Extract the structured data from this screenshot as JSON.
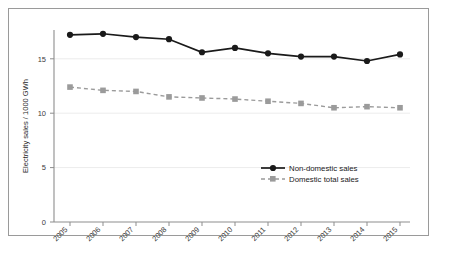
{
  "chart_data": {
    "type": "line",
    "title": "",
    "xlabel": "",
    "ylabel": "Electricity sales / 1000 GWh",
    "categories": [
      "2005",
      "2006",
      "2007",
      "2008",
      "2009",
      "2010",
      "2011",
      "2012",
      "2013",
      "2014",
      "2015"
    ],
    "x": [
      2005,
      2006,
      2007,
      2008,
      2009,
      2010,
      2011,
      2012,
      2013,
      2014,
      2015
    ],
    "ylim": [
      0,
      18.2
    ],
    "yticks": [
      0,
      5,
      10,
      15
    ],
    "ytick_labels": [
      "0",
      "5",
      "10",
      "15"
    ],
    "grid": "horizontal-faint",
    "legend_position": "center-right-inside",
    "xtick_rotation_degrees": 45,
    "series": [
      {
        "name": "Non-domestic sales",
        "color": "#1a1a1a",
        "line_style": "solid",
        "marker": "circle",
        "values": [
          17.2,
          17.3,
          17.0,
          16.8,
          15.6,
          16.0,
          15.5,
          15.2,
          15.2,
          14.8,
          15.4
        ]
      },
      {
        "name": "Domestic total sales",
        "color": "#9b9b9b",
        "line_style": "dashed",
        "marker": "square",
        "values": [
          12.4,
          12.1,
          12.0,
          11.5,
          11.4,
          11.3,
          11.1,
          10.9,
          10.5,
          10.6,
          10.5
        ]
      }
    ]
  },
  "legend": {
    "items": [
      {
        "label": "Non-domestic sales"
      },
      {
        "label": "Domestic total sales"
      }
    ]
  },
  "colors": {
    "series_primary": "#1a1a1a",
    "series_secondary": "#9b9b9b",
    "axis": "#8d8d8d",
    "grid": "#ececec",
    "frame_border": "#9a9a9a",
    "text": "#2a2a2a"
  }
}
